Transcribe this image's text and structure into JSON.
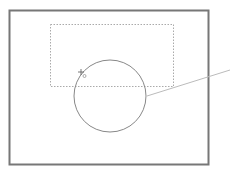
{
  "canvas": {
    "background": "#ffffff",
    "frame": {
      "x": 9,
      "y": 10,
      "width": 199,
      "height": 154,
      "stroke": "#777777"
    },
    "selection_rect": {
      "x": 50,
      "y": 24,
      "width": 123,
      "height": 62,
      "stroke": "#aaaaaa"
    },
    "circle": {
      "cx": 110,
      "cy": 96,
      "r": 36,
      "stroke": "#888888"
    },
    "connector_line": {
      "x1": 147,
      "y1": 96,
      "x2": 230,
      "y2": 70,
      "stroke": "#bbbbbb"
    },
    "cursor": {
      "x": 81,
      "y": 72,
      "icon": "crosshair-pen-cursor"
    }
  }
}
